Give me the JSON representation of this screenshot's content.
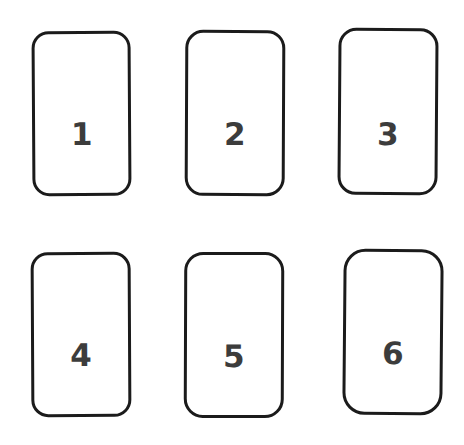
{
  "canvas": {
    "width": 464,
    "height": 445,
    "background_color": "#ffffff",
    "description": "Six rounded rectangle cards arranged in a two-row, three-column grid, each containing a bold number."
  },
  "style": {
    "card_fill_color": "#ffffff",
    "card_stroke_color": "#1b1b1b",
    "label_color": "#3c3c3c"
  },
  "grid": {
    "rows": 2,
    "columns": 3,
    "total_cards": 6
  },
  "cards": [
    {
      "id": "card-1",
      "label": "1",
      "row": 1,
      "column": 1
    },
    {
      "id": "card-2",
      "label": "2",
      "row": 1,
      "column": 2
    },
    {
      "id": "card-3",
      "label": "3",
      "row": 1,
      "column": 3
    },
    {
      "id": "card-4",
      "label": "4",
      "row": 2,
      "column": 1
    },
    {
      "id": "card-5",
      "label": "5",
      "row": 2,
      "column": 2
    },
    {
      "id": "card-6",
      "label": "6",
      "row": 2,
      "column": 3
    }
  ]
}
